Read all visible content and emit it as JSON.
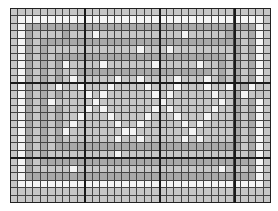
{
  "chart": {
    "title": "",
    "columns": 35,
    "rows": 26,
    "major_every": 10,
    "colors": {
      "W": "#f4f4f4",
      "L": "#c6c6c6",
      "M": "#a9a9a9",
      "grid": "#444444",
      "major": "#1a1a1a"
    },
    "pattern": [
      "LLLLLLLLLLLLLLLLLLLLLLLLLLLLLLLLLLL",
      "LWWWWWWWWWWWWWWWWWWWWWWWWWWWWWWWWWL",
      "LWMMMMMMMMMMMMMMMMMMMMMMMMMMMMMMMWL",
      "LWMLLLLMLLLWLLLLLLLLLLLWLLLLLMLLMWL",
      "LWMLMMMMMMMMMMMMMMMMMMMMMMMMMMMLMWL",
      "LWMLMLLLLLLLLLLLLWLLLWLLLLLLLLMLMWL",
      "LWMLMLMMMMMMMMMMMMMMMMMMMMMMMLMLMWL",
      "LWMLMLMWLLLLWLLLLLLWLLLLLWLLMLMLMWL",
      "LWMLMLMLLMMMMMMMMMMMMMMMMMMLMLMLMWL",
      "LWMLMLMLWLLLLLWLLWLLLLWLLLWLMLMLMWL",
      "LWMLMLWLLWLLLWLLLLWLLLWLLLWLLWLMWLL",
      "LWMLMLMLLLWLWLLLLLLWLWLLLLLWLLMWLLL",
      "LWMLMWLLLLLWLLLLLLLLWLLLLLLLWLMLMWL",
      "LWMLMLMLLLWLWLLLLLLWLWLLLLLWLLMLMWL",
      "LWMLMLMLLWLLLWLLLLWLLLWLLLWLLLMLMWL",
      "LWMLMLMLWLLLLLWLLWLLLLLWLWLLLLMLMWL",
      "LWMLMLMWLLLLLLLWWLLLLLLLWLLLLLMLMWL",
      "LWMLMLMLLLLLLLWLLWLLLLLWLWLLLLMLMWL",
      "LWMLMLMMMMMMMMMMMMMMMMMMMMMMMMMLMWL",
      "LWMLMLLLLLLLLLWLLLLLLLLLLLLLLLLLMWL",
      "LWMLMMMMMMMMMMMMMMMMMMMMMMMMMMMMMWL",
      "LWMLLLLLWLLLLLLLLLLLLLLLLLLLWLLLMWL",
      "LWMMMMMMMMMMMMMMMMMMMMMMMMMMMMMMMWL",
      "LWWWWWWWWWWWWWWWWWWWWWWWWWWWWWWWWWL",
      "LLLLLLLLLLLLLLLLLLLLLLLLLLLLLLLLLLL",
      "LLLLLLLLLLLLLLLLLLLLLLLLLLLLLLLLLLL"
    ]
  }
}
